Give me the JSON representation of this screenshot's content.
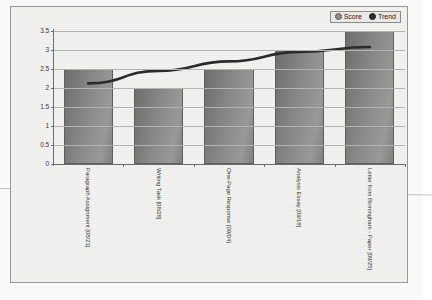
{
  "chart_data": {
    "type": "bar",
    "title": "",
    "xlabel": "",
    "ylabel": "",
    "ylim": [
      0,
      3.5
    ],
    "yticks": [
      "0",
      "0.5",
      "1",
      "1.5",
      "2",
      "2.5",
      "3",
      "3.5"
    ],
    "grid": true,
    "legend_position": "top-right",
    "categories": [
      "Paragraph Assignment [08/21]",
      "Writing Task [08/28]",
      "One-Page Response [09/04]",
      "Analysis Essay [09/18]",
      "Letter from Birmingham - Paper [09/25]"
    ],
    "series": [
      {
        "name": "Score",
        "type": "bar",
        "values": [
          2.5,
          2.0,
          2.5,
          3.0,
          3.5
        ]
      },
      {
        "name": "Trend",
        "type": "line",
        "values": [
          2.12,
          2.45,
          2.7,
          2.95,
          3.08
        ]
      }
    ]
  },
  "legend": {
    "items": [
      {
        "label": "Score",
        "marker": "circle-marker-score",
        "color": "#8c8c8c"
      },
      {
        "label": "Trend",
        "marker": "circle-marker-trend",
        "color": "#2e2e2e"
      }
    ]
  },
  "colors": {
    "bar_fill": "#8a8a8a",
    "bar_border": "#5f5f5f",
    "trend_line": "#2b2b2b",
    "axis": "#6e6e6e",
    "gridline": "#b5b5b5",
    "plot_background": "#f3f3f1",
    "page_background": "#fdfdfd"
  }
}
